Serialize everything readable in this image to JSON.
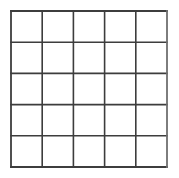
{
  "figure": {
    "name": "square-grid-figure",
    "background_color": "#ffffff",
    "line_color": "#3d3d3d",
    "line_color_light": "#6f6f6f",
    "cell_fill": "#ffffff",
    "line_width": 1.6,
    "outer_line_width": 1.8
  },
  "grid": {
    "rows": 5,
    "columns": 5,
    "cell_count": 25,
    "x_start": 11,
    "y_start": 11,
    "x_end": 167,
    "y_end": 167,
    "cell_width": 31.2,
    "cell_height": 31.2,
    "vertical_line_positions": [
      11,
      42.2,
      73.4,
      104.6,
      135.8,
      167
    ],
    "horizontal_line_positions": [
      11,
      42.2,
      73.4,
      104.6,
      135.8,
      167
    ],
    "vertical_line_count": 6,
    "horizontal_line_count": 6
  },
  "canvas": {
    "width": 179,
    "height": 178
  }
}
